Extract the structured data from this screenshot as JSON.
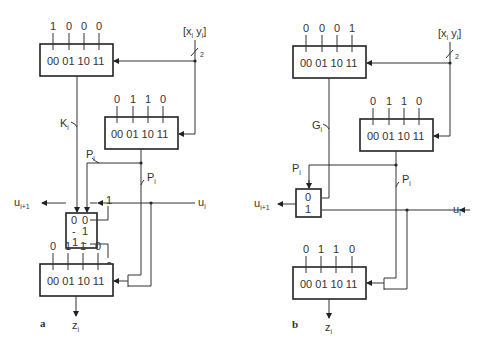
{
  "figure": {
    "panel_a": {
      "label": "a",
      "input_bus": {
        "text": "[x",
        "sub1": "i",
        "mid": " y",
        "sub2": "i",
        "end": "]",
        "width": "2"
      },
      "top_lut": {
        "data": [
          "1",
          "0",
          "0",
          "0"
        ],
        "addr": "00 01 10 11",
        "output": "K",
        "output_sub": "i"
      },
      "mid_lut": {
        "data": [
          "0",
          "1",
          "1",
          "0"
        ],
        "addr": "00 01 10 11",
        "output": "P",
        "output_sub": "i"
      },
      "mux": {
        "rows": [
          [
            "0",
            "0"
          ],
          [
            "-",
            "1"
          ],
          [
            "1",
            "-"
          ]
        ],
        "const_in_top": "1",
        "const_in_bottom": "0",
        "p_label": "P",
        "p_sub": "i"
      },
      "carry_out": "u",
      "carry_out_sub": "i+1",
      "carry_in": "u",
      "carry_in_sub": "i",
      "bot_lut": {
        "data": [
          "0",
          "1",
          "1",
          "0"
        ],
        "addr": "00 01 10 11",
        "output": "z",
        "output_sub": "i"
      }
    },
    "panel_b": {
      "label": "b",
      "input_bus": {
        "text": "[x",
        "sub1": "i",
        "mid": " y",
        "sub2": "i",
        "end": "]",
        "width": "2"
      },
      "top_lut": {
        "data": [
          "0",
          "0",
          "0",
          "1"
        ],
        "addr": "00 01 10 11",
        "output": "G",
        "output_sub": "i"
      },
      "mid_lut": {
        "data": [
          "0",
          "1",
          "1",
          "0"
        ],
        "addr": "00 01 10 11",
        "output": "P",
        "output_sub": "i"
      },
      "mux": {
        "rows": [
          "0",
          "1"
        ],
        "sel_label": "P",
        "sel_sub": "i"
      },
      "carry_out": "u",
      "carry_out_sub": "i+1",
      "carry_in": "u",
      "carry_in_sub": "i",
      "bot_lut": {
        "data": [
          "0",
          "1",
          "1",
          "0"
        ],
        "addr": "00 01 10 11",
        "output": "z",
        "output_sub": "i"
      }
    }
  }
}
